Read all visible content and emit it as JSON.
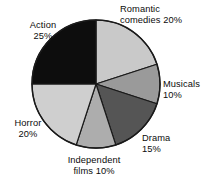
{
  "chart_data": {
    "type": "pie",
    "title": "",
    "subtitle": "",
    "xlabel": "",
    "ylabel": "",
    "legend_position": "none",
    "grid": false,
    "unit": "%",
    "start_angle_deg": 0,
    "direction": "clockwise",
    "categories": [
      "Romantic comedies",
      "Musicals",
      "Drama",
      "Independent films",
      "Horror",
      "Action"
    ],
    "values": [
      20,
      10,
      15,
      10,
      20,
      25
    ],
    "colors": [
      "#c9c9c9",
      "#9a9a9a",
      "#555555",
      "#adadad",
      "#cfcfcf",
      "#0d0d0d"
    ],
    "slices": [
      {
        "name": "Romantic comedies",
        "value": 20,
        "label": "Romantic\ncomedies 20%",
        "value_label": "20%",
        "color": "#c9c9c9"
      },
      {
        "name": "Musicals",
        "value": 10,
        "label": "Musicals\n10%",
        "value_label": "10%",
        "color": "#9a9a9a"
      },
      {
        "name": "Drama",
        "value": 15,
        "label": "Drama\n15%",
        "value_label": "15%",
        "color": "#555555"
      },
      {
        "name": "Independent films",
        "value": 10,
        "label": "Independent\nfilms 10%",
        "value_label": "10%",
        "color": "#adadad"
      },
      {
        "name": "Horror",
        "value": 20,
        "label": "Horror\n20%",
        "value_label": "20%",
        "color": "#cfcfcf"
      },
      {
        "name": "Action",
        "value": 25,
        "label": "Action\n25%",
        "value_label": "25%",
        "color": "#0d0d0d"
      }
    ]
  },
  "style": {
    "background": "#ffffff",
    "outline": "#1a1a1a",
    "text": "#0b0b0b"
  }
}
